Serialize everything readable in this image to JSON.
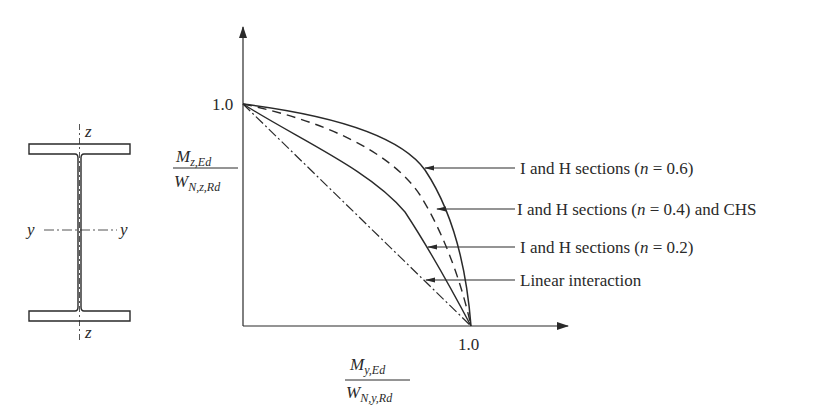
{
  "section": {
    "axis_z_top": "z",
    "axis_z_bottom": "z",
    "axis_y_left": "y",
    "axis_y_right": "y"
  },
  "axes": {
    "y_tick": "1.0",
    "x_tick": "1.0",
    "y_label": {
      "num_main": "M",
      "num_sub": "z,Ed",
      "den_main": "W",
      "den_sub": "N,z,Rd"
    },
    "x_label": {
      "num_main": "M",
      "num_sub": "y,Ed",
      "den_main": "W",
      "den_sub": "N,y,Rd"
    }
  },
  "legend": {
    "items": [
      {
        "pre": "I and H sections (",
        "var": "n",
        "post": " = 0.6)",
        "style": "solid"
      },
      {
        "pre": "I and H sections (",
        "var": "n",
        "post": " = 0.4) and CHS",
        "style": "dashed"
      },
      {
        "pre": "I and H sections (",
        "var": "n",
        "post": " = 0.2)",
        "style": "solid"
      },
      {
        "pre": "Linear interaction",
        "var": "",
        "post": "",
        "style": "dash-dot"
      }
    ]
  },
  "colors": {
    "ink": "#2a2a2a",
    "background": "#ffffff"
  }
}
